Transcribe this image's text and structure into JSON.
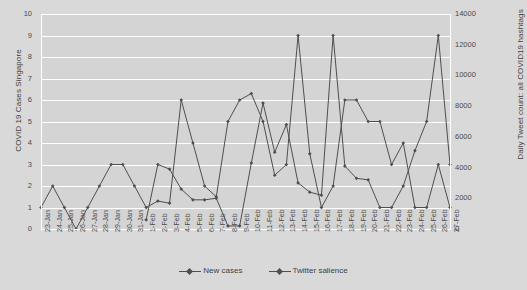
{
  "chart_data": {
    "type": "line",
    "title": "",
    "xlabel": "",
    "ylabel": "COVID 19 Cases Singapore",
    "y2label": "Daily Tweet count: all COVID19 hashtags",
    "ylim": [
      0,
      10
    ],
    "y2lim": [
      0,
      14000
    ],
    "grid": true,
    "legend_position": "bottom",
    "categories": [
      "23-Jan",
      "24-Jan",
      "25-Jan",
      "26-Jan",
      "27-Jan",
      "28-Jan",
      "29-Jan",
      "30-Jan",
      "31-Jan",
      "1-Feb",
      "2-Feb",
      "3-Feb",
      "4-Feb",
      "5-Feb",
      "6-Feb",
      "7-Feb",
      "8-Feb",
      "9-Feb",
      "10-Feb",
      "11-Feb",
      "12-Feb",
      "13-Feb",
      "14-Feb",
      "15-Feb",
      "16-Feb",
      "17-Feb",
      "18-Feb",
      "19-Feb",
      "20-Feb",
      "21-Feb",
      "22-Feb",
      "23-Feb",
      "24-Feb",
      "25-Feb",
      "26-Feb",
      "27-Feb"
    ],
    "yticks": [
      0,
      1,
      2,
      3,
      4,
      5,
      6,
      7,
      8,
      9,
      10
    ],
    "y2ticks": [
      0,
      2000,
      4000,
      6000,
      8000,
      10000,
      12000,
      14000
    ],
    "series": [
      {
        "name": "New cases",
        "axis": "left",
        "color": "#4f4f4f",
        "values": [
          1,
          2,
          1,
          0,
          1,
          2,
          3,
          3,
          2,
          1,
          1.3,
          1.2,
          6,
          4,
          2,
          1.5,
          5,
          6,
          6.3,
          5,
          2.5,
          3,
          9,
          3.5,
          1,
          2,
          6,
          6,
          5,
          5,
          3,
          4,
          1,
          1,
          3,
          1
        ]
      },
      {
        "name": "Twitter salience",
        "axis": "right",
        "color": "#4f4f4f",
        "values": [
          null,
          null,
          null,
          null,
          null,
          null,
          null,
          null,
          null,
          600,
          4200,
          3900,
          2600,
          1900,
          1900,
          2000,
          200,
          200,
          4300,
          8200,
          5000,
          6800,
          3000,
          2400,
          2200,
          12600,
          4100,
          3300,
          3200,
          1400,
          1400,
          2800,
          5100,
          7000,
          12600,
          4200
        ]
      }
    ],
    "legend": [
      "New cases",
      "Twitter salience"
    ]
  }
}
